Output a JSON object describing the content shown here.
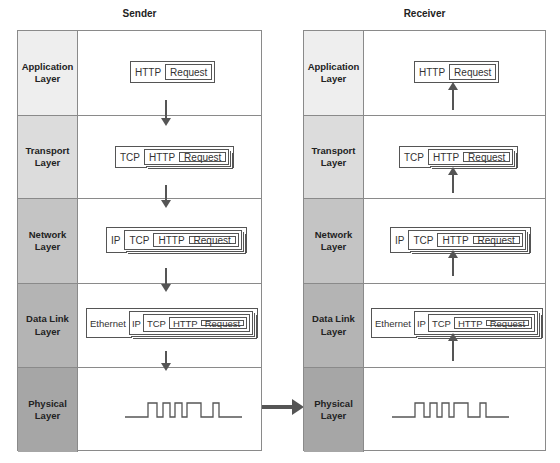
{
  "diagram": {
    "sender": {
      "title": "Sender",
      "layers": [
        {
          "name": "Application Layer",
          "line1": "Application",
          "line2": "Layer",
          "shade": "#eeeeee",
          "pdu": [
            "HTTP",
            "Request"
          ]
        },
        {
          "name": "Transport Layer",
          "line1": "Transport",
          "line2": "Layer",
          "shade": "#dcdcdc",
          "pdu": [
            "TCP",
            "HTTP",
            "Request"
          ]
        },
        {
          "name": "Network Layer",
          "line1": "Network",
          "line2": "Layer",
          "shade": "#c4c4c4",
          "pdu": [
            "IP",
            "TCP",
            "HTTP",
            "Request"
          ]
        },
        {
          "name": "Data Link Layer",
          "line1": "Data Link",
          "line2": "Layer",
          "shade": "#b4b4b4",
          "pdu": [
            "Ethernet",
            "IP",
            "TCP",
            "HTTP",
            "Request"
          ]
        },
        {
          "name": "Physical Layer",
          "line1": "Physical",
          "line2": "Layer",
          "shade": "#a6a6a6",
          "signal": "square-wave"
        }
      ],
      "flow_direction": "down"
    },
    "receiver": {
      "title": "Receiver",
      "layers": [
        {
          "name": "Application Layer",
          "line1": "Application",
          "line2": "Layer",
          "shade": "#eeeeee",
          "pdu": [
            "HTTP",
            "Request"
          ]
        },
        {
          "name": "Transport Layer",
          "line1": "Transport",
          "line2": "Layer",
          "shade": "#dcdcdc",
          "pdu": [
            "TCP",
            "HTTP",
            "Request"
          ]
        },
        {
          "name": "Network Layer",
          "line1": "Network",
          "line2": "Layer",
          "shade": "#c4c4c4",
          "pdu": [
            "IP",
            "TCP",
            "HTTP",
            "Request"
          ]
        },
        {
          "name": "Data Link Layer",
          "line1": "Data Link",
          "line2": "Layer",
          "shade": "#b4b4b4",
          "pdu": [
            "Ethernet",
            "IP",
            "TCP",
            "HTTP",
            "Request"
          ]
        },
        {
          "name": "Physical Layer",
          "line1": "Physical",
          "line2": "Layer",
          "shade": "#a6a6a6",
          "signal": "square-wave"
        }
      ],
      "flow_direction": "up"
    },
    "link_arrow": "sender-physical-to-receiver-physical",
    "colors": {
      "border": "#8a8a8a",
      "arrow": "#555555",
      "text": "#222222"
    }
  }
}
